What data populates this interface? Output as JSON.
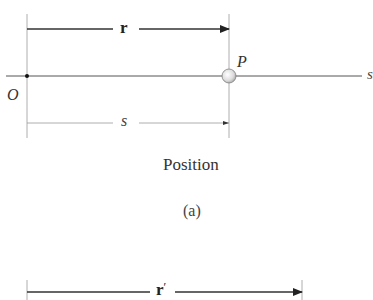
{
  "figure": {
    "panel_a": {
      "vector_label": "r",
      "point_label": "P",
      "origin_label": "O",
      "distance_label": "s",
      "axis_label": "s",
      "caption": "Position",
      "sublabel": "(a)"
    },
    "panel_b": {
      "vector_label": "r",
      "vector_prime": "′"
    }
  },
  "colors": {
    "line": "#4a4a4a",
    "light_line": "#9a9a9a",
    "text": "#333333",
    "particle_fill": "#e8e8e8",
    "particle_stroke": "#808080"
  }
}
